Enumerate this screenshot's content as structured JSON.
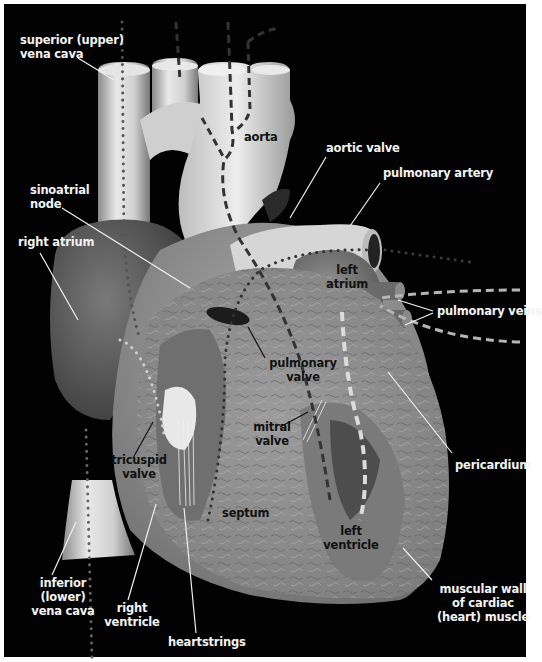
{
  "diagram": {
    "background_color": "#020202",
    "label_color_outside": "#f2f2f2",
    "label_color_inside": "#111111",
    "flow_line_color_dark": "#3a3a3a",
    "flow_line_color_light": "#bdbdbd"
  },
  "labels": {
    "superior_vena_cava": {
      "line1": "superior (upper)",
      "line2": "vena cava"
    },
    "aorta": {
      "line1": "aorta"
    },
    "aortic_valve": {
      "line1": "aortic valve"
    },
    "pulmonary_artery": {
      "line1": "pulmonary artery"
    },
    "sinoatrial_node": {
      "line1": "sinoatrial",
      "line2": "node"
    },
    "right_atrium": {
      "line1": "right atrium"
    },
    "left_atrium": {
      "line1": "left",
      "line2": "atrium"
    },
    "pulmonary_veins": {
      "line1": "pulmonary veins"
    },
    "pulmonary_valve": {
      "line1": "pulmonary",
      "line2": "valve"
    },
    "mitral_valve": {
      "line1": "mitral",
      "line2": "valve"
    },
    "tricuspid_valve": {
      "line1": "tricuspid",
      "line2": "valve"
    },
    "septum": {
      "line1": "septum"
    },
    "pericardium": {
      "line1": "pericardium"
    },
    "left_ventricle": {
      "line1": "left",
      "line2": "ventricle"
    },
    "muscular_wall": {
      "line1": "muscular wall",
      "line2": "of cardiac",
      "line3": "(heart) muscle"
    },
    "inferior_vena_cava": {
      "line1": "inferior",
      "line2": "(lower)",
      "line3": "vena cava"
    },
    "right_ventricle": {
      "line1": "right",
      "line2": "ventricle"
    },
    "heartstrings": {
      "line1": "heartstrings"
    }
  }
}
